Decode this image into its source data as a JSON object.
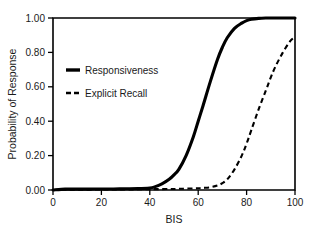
{
  "chart_data": {
    "type": "line",
    "title": "",
    "xlabel": "BIS",
    "ylabel": "Probability of Response",
    "xlim": [
      0,
      100
    ],
    "ylim": [
      0.0,
      1.0
    ],
    "grid": false,
    "legend_position": "upper-left-inside",
    "x_ticks": [
      "0",
      "20",
      "40",
      "60",
      "80",
      "100"
    ],
    "x_tick_values": [
      0,
      20,
      40,
      60,
      80,
      100
    ],
    "y_ticks": [
      "0.00",
      "0.20",
      "0.40",
      "0.60",
      "0.80",
      "1.00"
    ],
    "y_tick_values": [
      0.0,
      0.2,
      0.4,
      0.6,
      0.8,
      1.0
    ],
    "x": [
      0,
      5,
      10,
      15,
      20,
      25,
      30,
      35,
      40,
      42,
      45,
      48,
      50,
      52,
      55,
      58,
      60,
      62,
      65,
      68,
      70,
      72,
      75,
      78,
      80,
      82,
      85,
      88,
      90,
      92,
      95,
      98,
      100
    ],
    "series": [
      {
        "name": "Responsiveness",
        "style": "solid",
        "color": "#000000",
        "values": [
          0.0,
          0.005,
          0.005,
          0.005,
          0.006,
          0.006,
          0.007,
          0.008,
          0.012,
          0.018,
          0.035,
          0.062,
          0.088,
          0.12,
          0.2,
          0.31,
          0.4,
          0.49,
          0.63,
          0.76,
          0.83,
          0.885,
          0.94,
          0.97,
          0.985,
          0.993,
          0.998,
          1.0,
          1.0,
          1.0,
          1.0,
          1.0,
          1.0
        ]
      },
      {
        "name": "Explicit Recall",
        "style": "dashed",
        "color": "#000000",
        "values": [
          0.0,
          0.002,
          0.002,
          0.002,
          0.003,
          0.003,
          0.003,
          0.004,
          0.004,
          0.005,
          0.005,
          0.006,
          0.006,
          0.007,
          0.008,
          0.009,
          0.01,
          0.012,
          0.016,
          0.026,
          0.04,
          0.062,
          0.12,
          0.2,
          0.27,
          0.35,
          0.47,
          0.58,
          0.655,
          0.72,
          0.8,
          0.865,
          0.89
        ]
      }
    ],
    "legend_entries": [
      {
        "label": "Responsiveness",
        "style": "solid"
      },
      {
        "label": "Explicit Recall",
        "style": "dashed"
      }
    ]
  }
}
